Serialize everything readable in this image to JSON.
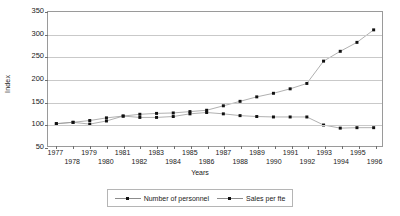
{
  "chart_data": {
    "type": "line",
    "title": "",
    "xlabel": "Years",
    "ylabel": "Index",
    "ylim": [
      50,
      350
    ],
    "ytick_values": [
      50,
      100,
      150,
      200,
      250,
      300,
      350
    ],
    "grid": true,
    "legend_position": "bottom",
    "categories": [
      1977,
      1978,
      1979,
      1980,
      1981,
      1982,
      1983,
      1984,
      1985,
      1986,
      1987,
      1988,
      1989,
      1990,
      1991,
      1992,
      1993,
      1994,
      1995,
      1996
    ],
    "series": [
      {
        "name": "Number of personnel",
        "values": [
          100,
          103,
          107,
          113,
          117,
          121,
          123,
          124,
          127,
          130,
          140,
          150,
          160,
          168,
          178,
          190,
          240,
          262,
          282,
          310
        ]
      },
      {
        "name": "Sales per fte",
        "values": [
          100,
          103,
          99,
          106,
          117,
          114,
          114,
          116,
          122,
          125,
          122,
          118,
          116,
          115,
          115,
          115,
          97,
          90,
          91,
          91
        ]
      }
    ]
  },
  "legend": {
    "entries": [
      {
        "label": "Number of personnel"
      },
      {
        "label": "Sales per fte"
      }
    ]
  },
  "axes": {
    "y_title": "Index",
    "x_title": "Years"
  }
}
